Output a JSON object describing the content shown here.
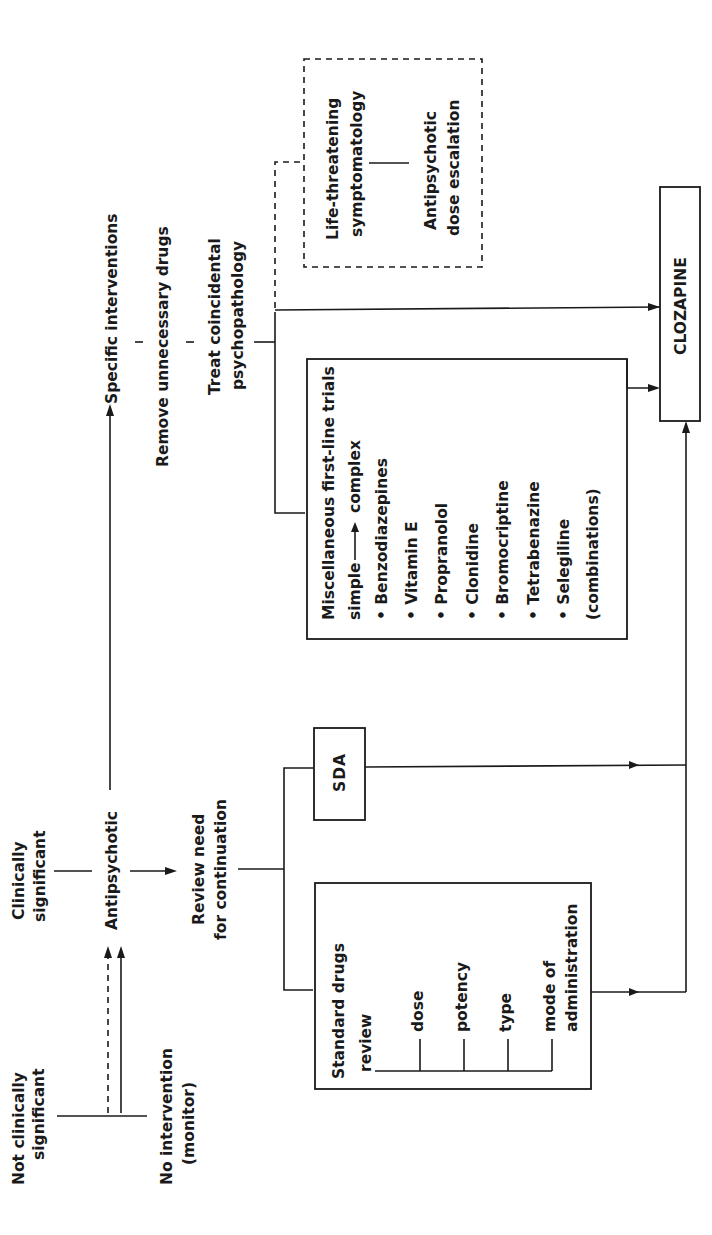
{
  "diagram": {
    "orientation": "rotated-90-ccw",
    "nodes": {
      "not_significant": [
        "Not clinically",
        "significant"
      ],
      "no_intervention": [
        "No intervention",
        "(monitor)"
      ],
      "clinically_significant": [
        "Clinically",
        "significant"
      ],
      "antipsychotic": "Antipsychotic",
      "review": [
        "Review need",
        "for continuation"
      ],
      "standard_drugs": {
        "title": [
          "Standard drugs",
          "review"
        ],
        "items": [
          "dose",
          "potency",
          "type",
          "mode of",
          "administration"
        ]
      },
      "sda": "SDA",
      "specific_interventions": "Specific interventions",
      "remove_drugs": "Remove unnecessary drugs",
      "treat": [
        "Treat coincidental",
        "psychopathology"
      ],
      "misc": {
        "title": "Miscellaneous first-line trials",
        "simple": "simple",
        "complex": "complex",
        "items": [
          "• Benzodiazepines",
          "• Vitamin E",
          "• Propranolol",
          "• Clonidine",
          "• Bromocriptine",
          "• Tetrabenazine",
          "• Selegiline",
          "(combinations)"
        ]
      },
      "life_threatening": [
        "Life-threatening",
        "symptomatology"
      ],
      "dose_escalation": [
        "Antipsychotic",
        "dose escalation"
      ],
      "clozapine": "CLOZAPINE"
    },
    "edges": [
      {
        "from": "no_intervention",
        "to": "antipsychotic",
        "style": "dashed"
      },
      {
        "from": "no_intervention",
        "to": "antipsychotic",
        "style": "solid"
      },
      {
        "from": "clinically_significant",
        "to": "antipsychotic",
        "style": "line"
      },
      {
        "from": "antipsychotic",
        "to": "review",
        "style": "arrow"
      },
      {
        "from": "antipsychotic",
        "to": "specific_interventions",
        "style": "arrow"
      },
      {
        "from": "review",
        "to": "standard_drugs",
        "style": "line"
      },
      {
        "from": "review",
        "to": "sda",
        "style": "line"
      },
      {
        "from": "standard_drugs",
        "to": "clozapine",
        "style": "arrow"
      },
      {
        "from": "sda",
        "to": "clozapine",
        "style": "arrow"
      },
      {
        "from": "treat",
        "to": "misc",
        "style": "line"
      },
      {
        "from": "treat",
        "to": "clozapine",
        "style": "arrow"
      },
      {
        "from": "misc",
        "to": "clozapine",
        "style": "arrow"
      },
      {
        "from": "treat",
        "to": "life_threatening",
        "style": "dashed"
      },
      {
        "from": "life_threatening",
        "to": "dose_escalation",
        "style": "line"
      }
    ]
  }
}
